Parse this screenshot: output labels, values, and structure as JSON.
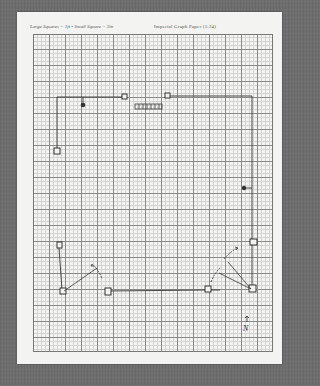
{
  "header": {
    "scale_note": "Large Squares = 1ft • Small Square = 3in",
    "title": "Imperial Graph Paper (1:24)"
  },
  "grid": {
    "large_square": "1ft",
    "small_square": "3in",
    "subdivisions_per_large": 4
  },
  "drawing": {
    "walls": "floor plan outline drawn in pencil",
    "compass_label": "N",
    "elements": [
      {
        "type": "outlet-square",
        "label": "top-wall-square-1"
      },
      {
        "type": "outlet-square",
        "label": "top-wall-square-2"
      },
      {
        "type": "radiator",
        "label": "radiator"
      },
      {
        "type": "light-fixture",
        "label": "ceiling-light-left"
      },
      {
        "type": "light-fixture",
        "label": "wall-light-right"
      },
      {
        "type": "outlet-square",
        "label": "left-wall-square-upper"
      },
      {
        "type": "outlet-square",
        "label": "left-wall-square-lower"
      },
      {
        "type": "outlet-square",
        "label": "bottom-left-corner-square"
      },
      {
        "type": "outlet-square",
        "label": "bottom-wall-square-1"
      },
      {
        "type": "outlet-square",
        "label": "bottom-wall-square-2"
      },
      {
        "type": "outlet-square",
        "label": "bottom-right-corner-square"
      },
      {
        "type": "outlet-square",
        "label": "right-wall-square"
      },
      {
        "type": "door-swing",
        "label": "door-left"
      },
      {
        "type": "door-swing",
        "label": "door-right"
      }
    ]
  },
  "colors": {
    "background": "#6e6e6e",
    "paper": "#f3f3f1",
    "pencil": "#333333",
    "grid_major": "#8a8a8a",
    "grid_minor": "#d4d4d4"
  }
}
